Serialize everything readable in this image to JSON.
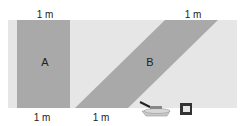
{
  "diagram": {
    "colors": {
      "background_strip": "#e6e6e6",
      "shape_fill": "#a9a9a9",
      "text": "#222222"
    },
    "labels": {
      "top_left": "1 m",
      "top_right": "1 m",
      "bottom_left": "1 m",
      "bottom_middle": "1 m",
      "shape_a": "A",
      "shape_b": "B"
    },
    "icons": [
      "paint-tray-roller-icon",
      "paint-can-icon"
    ]
  }
}
